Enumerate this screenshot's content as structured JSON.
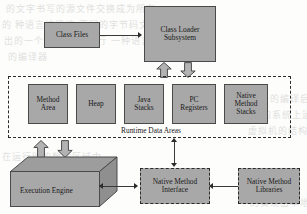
{
  "diagram": {
    "type": "block-diagram",
    "colors": {
      "node_fill": "#a8a8a8",
      "node_stroke": "#4a4a4a",
      "dashed_stroke": "#2b2b2b",
      "background": "#fdfdfc",
      "arrow_fill": "#b3b3b3",
      "arrow_stroke": "#4a4a4a",
      "text": "#1a1a1a"
    },
    "nodes": {
      "class_files": {
        "label": "Class Files"
      },
      "class_loader": {
        "label_line1": "Class Loader",
        "label_line2": "Subsystem"
      },
      "method_area": {
        "label_line1": "Method",
        "label_line2": "Area"
      },
      "heap": {
        "label": "Heap"
      },
      "java_stacks": {
        "label_line1": "Java",
        "label_line2": "Stacks"
      },
      "pc_registers": {
        "label_line1": "PC",
        "label_line2": "Registers"
      },
      "native_method_stacks": {
        "label_line1": "Native",
        "label_line2": "Method",
        "label_line3": "Stacks"
      },
      "runtime_data_areas": {
        "label": "Runtime Data Areas"
      },
      "execution_engine": {
        "label": "Execution Engine"
      },
      "native_method_interface": {
        "label_line1": "Native Method",
        "label_line2": "Interface"
      },
      "native_method_libraries": {
        "label_line1": "Native Method",
        "label_line2": "Libraries"
      }
    },
    "background_bleed": [
      {
        "text": "的文字书写的源文件交换成为所有"
      },
      {
        "text": "的  种语言编译编  不同的字节码文"
      },
      {
        "text": "出的一个在系统上  运行  一种语言"
      },
      {
        "text": "的编译器"
      },
      {
        "text": "这一的编译后的程序"
      },
      {
        "text": "构的系统上运行"
      },
      {
        "text": "虚拟机的结构"
      },
      {
        "text": "在运行时的数据区域中"
      },
      {
        "text": "的实现由本地方法接口"
      }
    ]
  }
}
